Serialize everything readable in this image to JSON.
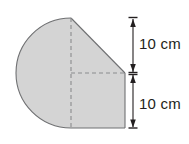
{
  "figure": {
    "fill_color": "#d4d4d4",
    "stroke_color": "#6f7072",
    "dashed_color": "#8a8b8d",
    "dimension_color": "#231f20",
    "background_color": "#ffffff",
    "shape": {
      "name": "composite-figure",
      "semicircle_center_x": 71,
      "semicircle_center_y": 73,
      "semicircle_radius": 55,
      "apex_x": 71,
      "apex_y": 18,
      "right_x": 125,
      "bottom_y": 128
    },
    "dimensions": [
      {
        "id": "upper",
        "label": "10 cm",
        "value": 10,
        "unit": "cm",
        "from_y": 18,
        "to_y": 73
      },
      {
        "id": "lower",
        "label": "10 cm",
        "value": 10,
        "unit": "cm",
        "from_y": 73,
        "to_y": 128
      }
    ],
    "dimension_line_x": 133,
    "guides": {
      "vertical_dashed_label": "vertical-center-dashed-line",
      "horizontal_dashed_label": "horizontal-radius-dashed-line"
    }
  }
}
